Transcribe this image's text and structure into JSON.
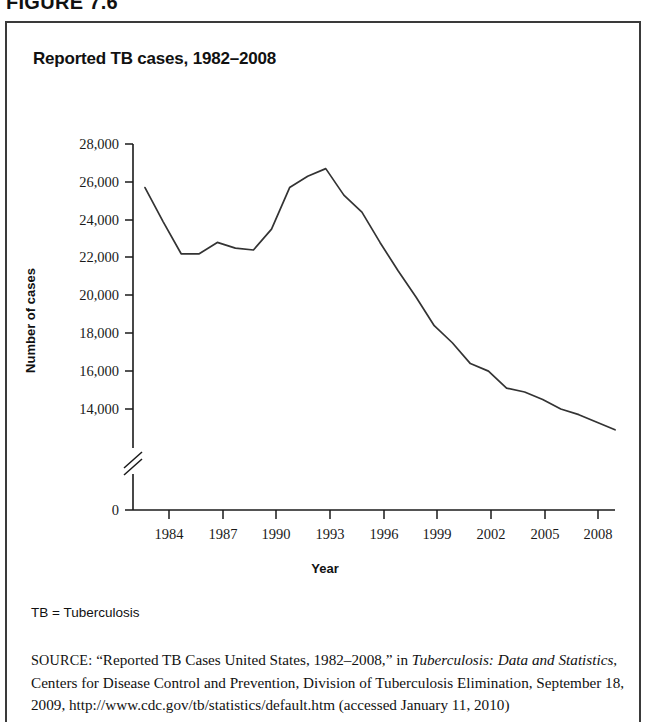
{
  "figure": {
    "label": "FIGURE 7.6",
    "title": "Reported TB cases, 1982–2008",
    "footnote": "TB = Tuberculosis"
  },
  "source": {
    "prefix": "SOURCE:",
    "part1": " “Reported TB Cases United States, 1982–2008,” in ",
    "italic": "Tuberculosis: Data and Statistics",
    "part2": ", Centers for Disease Control and Prevention, Division of Tuberculosis Elimination, September 18, 2009, http://www.cdc.gov/tb/statistics/default.htm (accessed January 11, 2010)"
  },
  "axis": {
    "y_title": "Number of cases",
    "x_title": "Year",
    "y_ticks": [
      "28,000",
      "26,000",
      "24,000",
      "22,000",
      "20,000",
      "18,000",
      "16,000",
      "14,000",
      "0"
    ],
    "x_ticks": [
      "1984",
      "1987",
      "1990",
      "1993",
      "1996",
      "1999",
      "2002",
      "2005",
      "2008"
    ],
    "break_marker": "axis-break"
  },
  "colors": {
    "line": "#333333",
    "axis": "#1a1a1a",
    "border": "#3a3a3a",
    "background": "#ffffff"
  },
  "chart_data": {
    "type": "line",
    "title": "Reported TB cases, 1982–2008",
    "xlabel": "Year",
    "ylabel": "Number of cases",
    "ylim": [
      13000,
      28000
    ],
    "xlim": [
      1982,
      2008
    ],
    "ytick_values": [
      14000,
      16000,
      18000,
      20000,
      22000,
      24000,
      26000,
      28000
    ],
    "xtick_values": [
      1984,
      1987,
      1990,
      1993,
      1996,
      1999,
      2002,
      2005,
      2008
    ],
    "grid": false,
    "legend": "none",
    "axis_break": {
      "between": [
        0,
        13000
      ],
      "note": "y-axis broken below 14,000 down to 0"
    },
    "x": [
      1982,
      1983,
      1984,
      1985,
      1986,
      1987,
      1988,
      1989,
      1990,
      1991,
      1992,
      1993,
      1994,
      1995,
      1996,
      1997,
      1998,
      1999,
      2000,
      2001,
      2002,
      2003,
      2004,
      2005,
      2006,
      2007,
      2008
    ],
    "series": [
      {
        "name": "Reported TB cases",
        "values": [
          25700,
          23900,
          22200,
          22200,
          22800,
          22500,
          22400,
          23500,
          25700,
          26300,
          26700,
          25300,
          24400,
          22800,
          21300,
          19900,
          18400,
          17500,
          16400,
          16000,
          15100,
          14900,
          14500,
          14000,
          13700,
          13300,
          12900
        ]
      }
    ]
  }
}
